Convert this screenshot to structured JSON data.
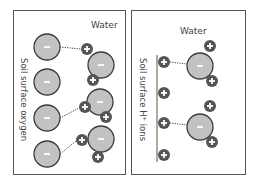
{
  "panels": [
    {
      "id": "left",
      "top_label": "Water",
      "side_label": "Soil surface oxygen",
      "surface_sites": [
        {
          "cx": 47,
          "cy": 47,
          "charge": "-"
        },
        {
          "cx": 47,
          "cy": 82,
          "charge": "-"
        },
        {
          "cx": 47,
          "cy": 118,
          "charge": "-"
        },
        {
          "cx": 47,
          "cy": 154,
          "charge": "-"
        }
      ],
      "water_molecules": [
        {
          "o": {
            "cx": 101,
            "cy": 65
          },
          "h": [
            {
              "cx": 87,
              "cy": 49
            },
            {
              "cx": 93,
              "cy": 80
            }
          ],
          "bond_from": {
            "x": 60,
            "y": 47
          },
          "bond_to": {
            "x": 81,
            "y": 49
          }
        },
        {
          "o": {
            "cx": 100,
            "cy": 102
          },
          "h": [
            {
              "cx": 85,
              "cy": 107
            },
            {
              "cx": 106,
              "cy": 117
            }
          ],
          "bond_from": {
            "x": 60,
            "y": 118
          },
          "bond_to": {
            "x": 79,
            "y": 108
          }
        },
        {
          "o": {
            "cx": 101,
            "cy": 139
          },
          "h": [
            {
              "cx": 82,
              "cy": 140
            },
            {
              "cx": 98,
              "cy": 157
            }
          ],
          "bond_from": {
            "x": 60,
            "y": 154
          },
          "bond_to": {
            "x": 76,
            "y": 141
          }
        }
      ]
    },
    {
      "id": "right",
      "top_label": "Water",
      "side_label": "Soil surface H⁺ ions",
      "surface_sites": [
        {
          "cx": 164,
          "cy": 62,
          "charge": "+"
        },
        {
          "cx": 164,
          "cy": 93,
          "charge": "+"
        },
        {
          "cx": 164,
          "cy": 123,
          "charge": "+"
        },
        {
          "cx": 164,
          "cy": 155,
          "charge": "+"
        }
      ],
      "water_molecules": [
        {
          "o": {
            "cx": 200,
            "cy": 66
          },
          "h": [
            {
              "cx": 210,
              "cy": 46
            },
            {
              "cx": 212,
              "cy": 81
            }
          ],
          "bond_from": {
            "x": 170,
            "y": 62
          },
          "bond_to": {
            "x": 187,
            "y": 64
          }
        },
        {
          "o": {
            "cx": 200,
            "cy": 127
          },
          "h": [
            {
              "cx": 210,
              "cy": 106
            },
            {
              "cx": 212,
              "cy": 142
            }
          ],
          "bond_from": {
            "x": 170,
            "y": 123
          },
          "bond_to": {
            "x": 187,
            "y": 125
          }
        }
      ]
    }
  ],
  "colors": {
    "oxygen_fill": "#c2c2c2",
    "oxygen_stroke": "#3c3c3c",
    "hydrogen_fill": "#555555",
    "frame": "#555555",
    "text": "#444444"
  }
}
